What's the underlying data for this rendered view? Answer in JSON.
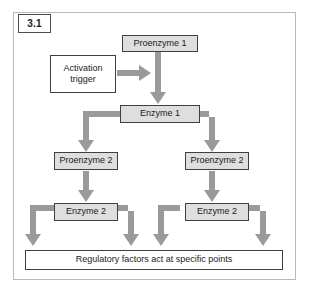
{
  "figure": {
    "number": "3.1",
    "background_color": "#ffffff",
    "frame_border_color": "#b9b9bc",
    "arrow_color": "#9a9a9c",
    "shaded_node_fill": "#dededf",
    "node_border_color": "#3f3f3f"
  },
  "diagram": {
    "type": "flowchart",
    "nodes": [
      {
        "id": "proenzyme-1",
        "label": "Proenzyme 1",
        "style": "shaded"
      },
      {
        "id": "activation-trigger",
        "label": "Activation\ntrigger",
        "style": "plain"
      },
      {
        "id": "enzyme-1",
        "label": "Enzyme 1",
        "style": "shaded"
      },
      {
        "id": "proenzyme-2-left",
        "label": "Proenzyme 2",
        "style": "shaded"
      },
      {
        "id": "proenzyme-2-right",
        "label": "Proenzyme 2",
        "style": "shaded"
      },
      {
        "id": "enzyme-2-left",
        "label": "Enzyme 2",
        "style": "shaded"
      },
      {
        "id": "enzyme-2-right",
        "label": "Enzyme 2",
        "style": "shaded"
      },
      {
        "id": "regulatory-factors",
        "label": "Regulatory factors act at specific points",
        "style": "plain"
      }
    ],
    "labels": {
      "proenzyme_1": "Proenzyme 1",
      "activation_trigger_line1": "Activation",
      "activation_trigger_line2": "trigger",
      "enzyme_1": "Enzyme 1",
      "proenzyme_2_left": "Proenzyme 2",
      "proenzyme_2_right": "Proenzyme 2",
      "enzyme_2_left": "Enzyme 2",
      "enzyme_2_right": "Enzyme 2",
      "regulatory_factors": "Regulatory factors act at specific points"
    },
    "edges": [
      {
        "from": "proenzyme-1",
        "to": "enzyme-1",
        "kind": "straight-down"
      },
      {
        "from": "activation-trigger",
        "to": "proenzyme-1-arrow",
        "kind": "straight-right"
      },
      {
        "from": "enzyme-1",
        "to": "proenzyme-2-left",
        "kind": "elbow-left-down"
      },
      {
        "from": "enzyme-1",
        "to": "proenzyme-2-right",
        "kind": "elbow-right-down"
      },
      {
        "from": "proenzyme-2-left",
        "to": "enzyme-2-left",
        "kind": "straight-down"
      },
      {
        "from": "proenzyme-2-right",
        "to": "enzyme-2-right",
        "kind": "straight-down"
      },
      {
        "from": "enzyme-2-left",
        "to": "regulatory-factors",
        "kind": "elbow-left-down"
      },
      {
        "from": "enzyme-2-left",
        "to": "regulatory-factors",
        "kind": "elbow-right-down"
      },
      {
        "from": "enzyme-2-right",
        "to": "regulatory-factors",
        "kind": "elbow-left-down"
      },
      {
        "from": "enzyme-2-right",
        "to": "regulatory-factors",
        "kind": "elbow-right-down"
      }
    ]
  }
}
